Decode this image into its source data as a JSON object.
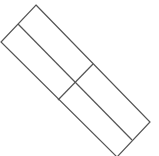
{
  "diagram": {
    "stroke_color": "#555555",
    "background": "#ffffff",
    "stroke_width": 1.2,
    "outline": [
      [
        36,
        5
      ],
      [
        150,
        122
      ],
      [
        117,
        157
      ],
      [
        1,
        42
      ]
    ],
    "long_divider": [
      [
        18,
        24
      ],
      [
        132,
        140
      ]
    ],
    "cross_divider": [
      [
        93,
        64
      ],
      [
        58,
        100
      ]
    ]
  }
}
